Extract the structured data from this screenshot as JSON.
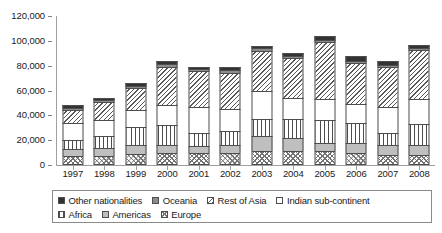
{
  "chart_data": {
    "type": "bar",
    "stacked": true,
    "title": "",
    "xlabel": "",
    "ylabel": "",
    "ylim": [
      0,
      120000
    ],
    "ytick_labels": [
      "0",
      "20,000",
      "40,000",
      "60,000",
      "80,000",
      "100,000",
      "120,000"
    ],
    "ytick_values": [
      0,
      20000,
      40000,
      60000,
      80000,
      100000,
      120000
    ],
    "grid": false,
    "legend_position": "bottom",
    "categories": [
      "1997",
      "1998",
      "1999",
      "2000",
      "2001",
      "2002",
      "2003",
      "2004",
      "2005",
      "2006",
      "2007",
      "2008"
    ],
    "series": [
      {
        "name": "Europe",
        "fill": "wave",
        "values": [
          7000,
          7500,
          9000,
          9500,
          9500,
          10000,
          11000,
          11000,
          11000,
          10000,
          8000,
          8000
        ]
      },
      {
        "name": "Americas",
        "fill": "gray-light",
        "values": [
          5500,
          6000,
          7000,
          6500,
          6000,
          6500,
          12000,
          11000,
          7000,
          8000,
          8000,
          8000
        ]
      },
      {
        "name": "Africa",
        "fill": "vert",
        "values": [
          8000,
          10000,
          15000,
          16000,
          10000,
          11000,
          14000,
          15000,
          18000,
          16000,
          10000,
          17000
        ]
      },
      {
        "name": "Indian sub-continent",
        "fill": "white",
        "values": [
          13000,
          13000,
          13000,
          16000,
          21000,
          18000,
          23000,
          17000,
          17000,
          15000,
          21000,
          20000
        ]
      },
      {
        "name": "Rest of Asia",
        "fill": "diag",
        "values": [
          11000,
          14000,
          18000,
          31000,
          29000,
          29000,
          32000,
          32000,
          46000,
          33000,
          32000,
          40000
        ]
      },
      {
        "name": "Oceania",
        "fill": "gray-dark",
        "values": [
          1500,
          1500,
          1500,
          2000,
          1500,
          2000,
          2000,
          2000,
          2000,
          2000,
          2000,
          1500
        ]
      },
      {
        "name": "Other nationalities",
        "fill": "solid-black",
        "values": [
          2000,
          2000,
          2500,
          3000,
          2000,
          2500,
          2000,
          2000,
          3000,
          4000,
          3000,
          2500
        ]
      }
    ],
    "totals": [
      48000,
      54000,
      66000,
      84000,
      79000,
      79000,
      96000,
      90000,
      104000,
      88000,
      84000,
      97000
    ]
  },
  "legend": {
    "row1": [
      {
        "label": "Other nationalities",
        "fill": "solid-black"
      },
      {
        "label": "Oceania",
        "fill": "gray-dark"
      },
      {
        "label": "Rest of Asia",
        "fill": "diag"
      },
      {
        "label": "Indian sub-continent",
        "fill": "white"
      }
    ],
    "row2": [
      {
        "label": "Africa",
        "fill": "vert"
      },
      {
        "label": "Americas",
        "fill": "gray-light"
      },
      {
        "label": "Europe",
        "fill": "wave"
      }
    ]
  },
  "colors": {
    "axis": "#a0a0a0",
    "text": "#1a1a1a",
    "segment_border": "#4d4d4d",
    "legend_border": "#8a8a8a",
    "background": "#ffffff"
  }
}
